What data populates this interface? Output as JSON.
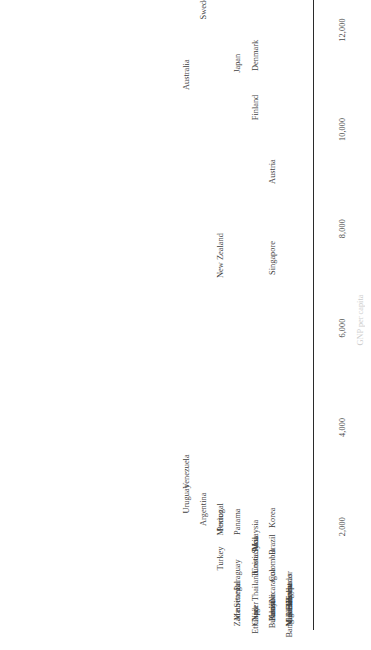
{
  "chart_data": {
    "type": "scatter",
    "title": "",
    "subtitle": "",
    "xlabel": "GNP per capita",
    "ylabel": "",
    "orientation": "labels-rotated-90",
    "grid": false,
    "legend": null,
    "xlim": [
      0,
      13200
    ],
    "xticks": [
      2000,
      4000,
      6000,
      8000,
      10000,
      12000
    ],
    "xtick_labels": [
      "2,000",
      "4,000",
      "6,000",
      "8,000",
      "10,000",
      "12,000"
    ],
    "note": "Dot/strip plot: each country label is placed at its value along the axis; vertical offset (row) is only to avoid label overlap.",
    "points": [
      {
        "label": "Egypt",
        "value": 660,
        "row": 0
      },
      {
        "label": "India",
        "value": 350,
        "row": 1
      },
      {
        "label": "Ethiopia",
        "value": 130,
        "row": 2
      },
      {
        "label": "Zaire",
        "value": 170,
        "row": 3
      },
      {
        "label": "Chad",
        "value": 190,
        "row": 2
      },
      {
        "label": "Benin",
        "value": 380,
        "row": 0
      },
      {
        "label": "Pakistan",
        "value": 380,
        "row": 1
      },
      {
        "label": "Turkey",
        "value": 1360,
        "row": 4
      },
      {
        "label": "Senegal",
        "value": 640,
        "row": 3
      },
      {
        "label": "Niger",
        "value": 290,
        "row": 2
      },
      {
        "label": "Burundi",
        "value": 230,
        "row": 1
      },
      {
        "label": "Nigeria",
        "value": 250,
        "row": 0
      },
      {
        "label": "Tunisia",
        "value": 1230,
        "row": 2
      },
      {
        "label": "Mauritania",
        "value": 480,
        "row": 3
      },
      {
        "label": "Bolivia",
        "value": 580,
        "row": 0
      },
      {
        "label": "Kenya",
        "value": 330,
        "row": 1
      },
      {
        "label": "Paraguay",
        "value": 1030,
        "row": 3
      },
      {
        "label": "Argentina",
        "value": 2350,
        "row": 5
      },
      {
        "label": "Thailand",
        "value": 800,
        "row": 2
      },
      {
        "label": "Bangladesh",
        "value": 160,
        "row": 0
      },
      {
        "label": "Syria",
        "value": 1640,
        "row": 2
      },
      {
        "label": "Uruguay",
        "value": 2560,
        "row": 6
      },
      {
        "label": "Colombia",
        "value": 1230,
        "row": 1
      },
      {
        "label": "Mexico",
        "value": 2080,
        "row": 4
      },
      {
        "label": "Nicaragua",
        "value": 820,
        "row": 1
      },
      {
        "label": "Panama",
        "value": 2100,
        "row": 3
      },
      {
        "label": "Malaysia",
        "value": 1830,
        "row": 2
      },
      {
        "label": "Honduras",
        "value": 730,
        "row": 0
      },
      {
        "label": "Venezuela",
        "value": 3110,
        "row": 6
      },
      {
        "label": "Brazil",
        "value": 1640,
        "row": 1
      },
      {
        "label": "Portugal",
        "value": 2190,
        "row": 4
      },
      {
        "label": "Mali",
        "value": 150,
        "row": 0
      },
      {
        "label": "El Salvador",
        "value": 710,
        "row": 0
      },
      {
        "label": "Korea",
        "value": 2180,
        "row": 1
      },
      {
        "label": "Costa Rica",
        "value": 1430,
        "row": 2
      },
      {
        "label": "Singapore",
        "value": 7410,
        "row": 1
      },
      {
        "label": "New Zealand",
        "value": 7460,
        "row": 4
      },
      {
        "label": "Australia",
        "value": 11100,
        "row": 6
      },
      {
        "label": "Finland",
        "value": 10440,
        "row": 2
      },
      {
        "label": "Japan",
        "value": 11330,
        "row": 3
      },
      {
        "label": "Austria",
        "value": 9150,
        "row": 1
      },
      {
        "label": "Canada",
        "value": 13670,
        "row": 4
      },
      {
        "label": "United States",
        "value": 13160,
        "row": 3
      },
      {
        "label": "Switzerland",
        "value": 16380,
        "row": 8
      },
      {
        "label": "Norway",
        "value": 14370,
        "row": 6
      },
      {
        "label": "Sweden",
        "value": 12480,
        "row": 5
      },
      {
        "label": "Denmark",
        "value": 11490,
        "row": 2
      }
    ]
  }
}
